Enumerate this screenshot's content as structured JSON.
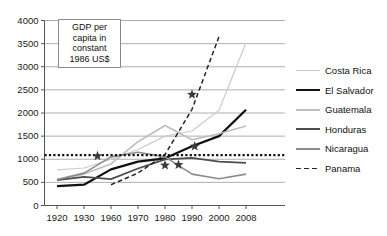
{
  "chart_data": {
    "type": "line",
    "title": "",
    "annotation": {
      "lines": [
        "GDP per",
        "capita in",
        "constant",
        "1986 US$"
      ],
      "text": "GDP per capita in constant 1986 US$"
    },
    "xlabel": "",
    "ylabel": "",
    "categories": [
      "1920",
      "1930",
      "1960",
      "1970",
      "1980",
      "1990",
      "2000",
      "2008"
    ],
    "xticks": [
      "1920",
      "1930",
      "1960",
      "1970",
      "1980",
      "1990",
      "2000",
      "2008"
    ],
    "yticks": [
      "0",
      "500",
      "1000",
      "1500",
      "2000",
      "2500",
      "3000",
      "3500",
      "4000"
    ],
    "ylim": [
      0,
      4000
    ],
    "grid": true,
    "grid_axis": "y",
    "legend_position": "right",
    "reference_line": {
      "label": "poverty reference",
      "value": 1090,
      "style": "dotted",
      "color": "#111111"
    },
    "series": [
      {
        "name": "Costa Rica",
        "color": "#cccccc",
        "width": 1.2,
        "dash": "none",
        "values": [
          770,
          810,
          1000,
          1210,
          1500,
          1610,
          2060,
          3520
        ]
      },
      {
        "name": "El Salvador",
        "color": "#111111",
        "width": 2.2,
        "dash": "none",
        "values": [
          420,
          450,
          780,
          950,
          1020,
          1280,
          1500,
          2070
        ]
      },
      {
        "name": "Guatemala",
        "color": "#bdbdbd",
        "width": 1.6,
        "dash": "none",
        "values": [
          560,
          680,
          900,
          1380,
          1730,
          1420,
          1550,
          1720
        ]
      },
      {
        "name": "Honduras",
        "color": "#4d4d4d",
        "width": 1.8,
        "dash": "none",
        "values": [
          550,
          620,
          570,
          800,
          1000,
          1030,
          950,
          920
        ]
      },
      {
        "name": "Nicaragua",
        "color": "#8c8c8c",
        "width": 1.6,
        "dash": "none",
        "values": [
          560,
          700,
          1050,
          1150,
          1050,
          680,
          580,
          680
        ]
      },
      {
        "name": "Panama",
        "color": "#222222",
        "width": 1.5,
        "dash": "dashed",
        "values": [
          null,
          null,
          450,
          700,
          1100,
          2080,
          3650,
          null
        ]
      }
    ],
    "markers": [
      {
        "series": "Nicaragua",
        "x": 1945,
        "y": 1070,
        "shape": "star"
      },
      {
        "series": "El Salvador",
        "x": 1980,
        "y": 870,
        "shape": "star"
      },
      {
        "series": "Nicaragua",
        "x": 1985,
        "y": 880,
        "shape": "star"
      },
      {
        "series": "El Salvador",
        "x": 1991,
        "y": 1280,
        "shape": "star"
      },
      {
        "series": "Panama",
        "x": 1990,
        "y": 2400,
        "shape": "star"
      }
    ]
  },
  "legend": {
    "items": [
      {
        "label": "Costa Rica"
      },
      {
        "label": "El Salvador"
      },
      {
        "label": "Guatemala"
      },
      {
        "label": "Honduras"
      },
      {
        "label": "Nicaragua"
      },
      {
        "label": "Panama"
      }
    ]
  }
}
